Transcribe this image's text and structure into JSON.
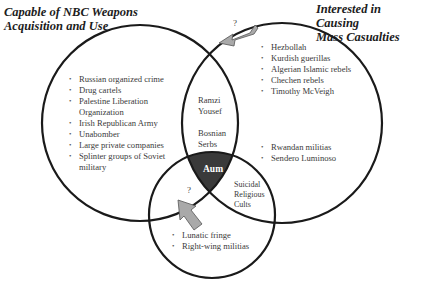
{
  "titles": {
    "left": [
      "Capable of NBC Weapons",
      "Acquisition and Use"
    ],
    "right": [
      "Interested in Causing",
      "Mass Casualties"
    ]
  },
  "regions": {
    "left_only": [
      "Russian organized crime",
      "Drug cartels",
      "Palestine Liberation Organization",
      "Irish Republican Army",
      "Unabomber",
      "Large private companies",
      "Splinter groups of Soviet military"
    ],
    "right_only_upper": [
      "Hezbollah",
      "Kurdish guerillas",
      "Algerian Islamic rebels",
      "Chechen rebels",
      "Timothy McVeigh"
    ],
    "right_only_lower": [
      "Rwandan militias",
      "Sendero Luminoso"
    ],
    "left_right_overlap": [
      "Ramzi Yousef",
      "Bosnian Serbs"
    ],
    "center_all_three": "Aum",
    "right_bottom_overlap": "Suicidal Religious Cults",
    "bottom_only": [
      "Lunatic fringe",
      "Right-wing militias"
    ]
  },
  "arrows": [
    {
      "label": "?",
      "direction": "toward left-right overlap"
    },
    {
      "label": "?",
      "direction": "toward left-bottom overlap"
    }
  ],
  "colors": {
    "circle_stroke": "#1a1a1a",
    "center_fill": "#3a3a3a",
    "arrow_fill": "#a9a9a9",
    "arrow_stroke": "#555555"
  }
}
